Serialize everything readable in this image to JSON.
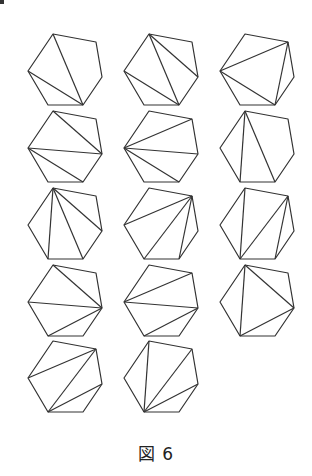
{
  "figure": {
    "caption": "図 6",
    "count": 14,
    "stroke_color": "#333333",
    "hexagon_offsets": [
      [
        0,
        0
      ],
      [
        43,
        8
      ],
      [
        49,
        43
      ],
      [
        30,
        71
      ],
      [
        -5,
        71
      ],
      [
        -25,
        37
      ]
    ],
    "cells": [
      {
        "origin": [
          53,
          34
        ],
        "diagonals": [
          [
            0,
            3
          ],
          [
            5,
            3
          ]
        ]
      },
      {
        "origin": [
          149,
          34
        ],
        "diagonals": [
          [
            0,
            3
          ],
          [
            0,
            2
          ],
          [
            5,
            3
          ]
        ]
      },
      {
        "origin": [
          245,
          34
        ],
        "diagonals": [
          [
            5,
            1
          ],
          [
            5,
            3
          ],
          [
            1,
            3
          ]
        ]
      },
      {
        "origin": [
          53,
          111
        ],
        "diagonals": [
          [
            0,
            2
          ],
          [
            5,
            2
          ],
          [
            5,
            3
          ]
        ]
      },
      {
        "origin": [
          149,
          111
        ],
        "diagonals": [
          [
            5,
            1
          ],
          [
            5,
            2
          ],
          [
            5,
            3
          ]
        ]
      },
      {
        "origin": [
          245,
          111
        ],
        "diagonals": [
          [
            0,
            4
          ],
          [
            0,
            3
          ]
        ]
      },
      {
        "origin": [
          53,
          188
        ],
        "diagonals": [
          [
            0,
            4
          ],
          [
            0,
            3
          ],
          [
            0,
            2
          ]
        ]
      },
      {
        "origin": [
          149,
          188
        ],
        "diagonals": [
          [
            5,
            1
          ],
          [
            1,
            4
          ],
          [
            1,
            3
          ]
        ]
      },
      {
        "origin": [
          245,
          188
        ],
        "diagonals": [
          [
            0,
            4
          ],
          [
            4,
            1
          ],
          [
            1,
            3
          ]
        ]
      },
      {
        "origin": [
          53,
          265
        ],
        "diagonals": [
          [
            0,
            2
          ],
          [
            5,
            2
          ],
          [
            2,
            4
          ]
        ]
      },
      {
        "origin": [
          149,
          265
        ],
        "diagonals": [
          [
            5,
            1
          ],
          [
            5,
            2
          ],
          [
            2,
            4
          ]
        ]
      },
      {
        "origin": [
          245,
          265
        ],
        "diagonals": [
          [
            0,
            4
          ],
          [
            0,
            2
          ],
          [
            2,
            4
          ]
        ]
      },
      {
        "origin": [
          53,
          341
        ],
        "diagonals": [
          [
            5,
            1
          ],
          [
            1,
            4
          ],
          [
            4,
            2
          ]
        ]
      },
      {
        "origin": [
          149,
          341
        ],
        "diagonals": [
          [
            0,
            4
          ],
          [
            4,
            1
          ],
          [
            4,
            2
          ]
        ]
      }
    ]
  }
}
